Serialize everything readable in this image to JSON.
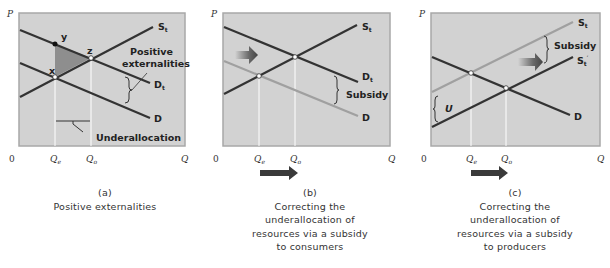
{
  "colors": {
    "panel_bg": "#d2d2d2",
    "panel_border": "#a8a8a8",
    "dark_line": "#333333",
    "light_line": "#a0a0a0",
    "triangle_fill": "#8e8e8e",
    "arrow": "#3a3a3a",
    "guide_line": "#ffffff"
  },
  "axes": {
    "y_label": "P",
    "x_label": "Q",
    "origin": "0",
    "qe_main": "Q",
    "qe_sub": "e",
    "qo_main": "Q",
    "qo_sub": "o"
  },
  "panels": [
    {
      "id": "a",
      "letter": "(a)",
      "caption_lines": [
        "Positive externalities"
      ],
      "labels": {
        "st_main": "S",
        "st_sub": "t",
        "dt_main": "D",
        "dt_sub": "t",
        "d": "D",
        "point_x": "x",
        "point_y": "y",
        "point_z": "z",
        "positive": "Positive",
        "externalities": "externalities",
        "underallocation": "Underallocation"
      }
    },
    {
      "id": "b",
      "letter": "(b)",
      "caption_lines": [
        "Correcting the",
        "underallocation of",
        "resources via a subsidy",
        "to consumers"
      ],
      "labels": {
        "st_main": "S",
        "st_sub": "t",
        "dt_main": "D",
        "dt_sub": "t",
        "d": "D",
        "subsidy": "Subsidy"
      }
    },
    {
      "id": "c",
      "letter": "(c)",
      "caption_lines": [
        "Correcting the",
        "underallocation of",
        "resources via a subsidy",
        "to producers"
      ],
      "labels": {
        "st_main": "S",
        "st_sub": "t",
        "stp_main": "S",
        "stp_sub": "t",
        "stp_prime": "′",
        "d": "D",
        "subsidy": "Subsidy",
        "u": "U"
      }
    }
  ]
}
